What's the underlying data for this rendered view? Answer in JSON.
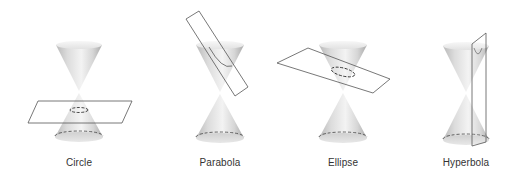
{
  "figure": {
    "type": "conic-sections-diagram",
    "panels": [
      {
        "id": "circle",
        "label": "Circle",
        "label_x": 79,
        "plane": "horizontal"
      },
      {
        "id": "parabola",
        "label": "Parabola",
        "label_x": 220,
        "plane": "parallel-to-side"
      },
      {
        "id": "ellipse",
        "label": "Ellipse",
        "label_x": 343,
        "plane": "tilted"
      },
      {
        "id": "hyperbola",
        "label": "Hyperbola",
        "label_x": 466,
        "plane": "vertical"
      }
    ]
  },
  "colors": {
    "background": "#ffffff",
    "plane_stroke": "#555555",
    "dash_stroke": "#444444",
    "cone_light": "#f4f4f4",
    "cone_dark": "#9a9a9a",
    "label_text": "#333333"
  }
}
